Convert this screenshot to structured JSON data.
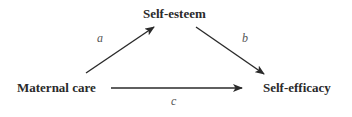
{
  "diagram": {
    "type": "mediation-model",
    "nodes": {
      "mediator": {
        "label": "Self-esteem"
      },
      "predictor": {
        "label": "Maternal care"
      },
      "outcome": {
        "label": "Self-efficacy"
      }
    },
    "paths": {
      "a": {
        "label": "a",
        "from": "Maternal care",
        "to": "Self-esteem"
      },
      "b": {
        "label": "b",
        "from": "Self-esteem",
        "to": "Self-efficacy"
      },
      "c": {
        "label": "c",
        "from": "Maternal care",
        "to": "Self-efficacy"
      }
    },
    "colors": {
      "text": "#2a2a2a",
      "arrow": "#2a2a2a",
      "path_label": "#555555",
      "background": "#ffffff"
    }
  }
}
